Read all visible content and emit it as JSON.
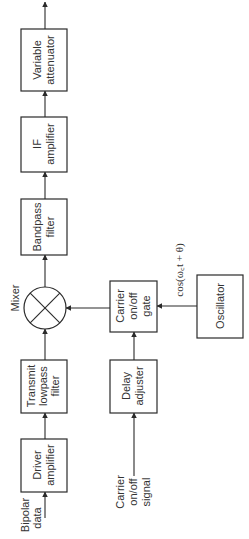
{
  "diagram": {
    "type": "block-diagram",
    "orientation": "rotated-90-ccw",
    "blocks": {
      "variable_attenuator": [
        "Variable",
        "attenuator"
      ],
      "if_amplifier": [
        "IF",
        "amplifier"
      ],
      "bandpass_filter": [
        "Bandpass",
        "filter"
      ],
      "transmit_lowpass_filter": [
        "Transmit",
        "lowpass",
        "filter"
      ],
      "driver_amplifier": [
        "Driver",
        "amplifier"
      ],
      "carrier_gate": [
        "Carrier",
        "on/off",
        "gate"
      ],
      "delay_adjuster": [
        "Delay",
        "adjuster"
      ],
      "oscillator": [
        "Oscillator"
      ]
    },
    "mixer_label": "Mixer",
    "inputs": {
      "bipolar_data": [
        "Bipolar",
        "data"
      ],
      "carrier_signal": [
        "Carrier",
        "on/off",
        "signal"
      ]
    },
    "oscillator_signal": "cos(ω꜀t + θ)",
    "connections": [
      [
        "Bipolar data",
        "Driver amplifier"
      ],
      [
        "Driver amplifier",
        "Transmit lowpass filter"
      ],
      [
        "Transmit lowpass filter",
        "Mixer"
      ],
      [
        "Carrier on/off signal",
        "Delay adjuster"
      ],
      [
        "Delay adjuster",
        "Carrier on/off gate"
      ],
      [
        "Oscillator",
        "Carrier on/off gate"
      ],
      [
        "Carrier on/off gate",
        "Mixer"
      ],
      [
        "Mixer",
        "Bandpass filter"
      ],
      [
        "Bandpass filter",
        "IF amplifier"
      ],
      [
        "IF amplifier",
        "Variable attenuator"
      ],
      [
        "Variable attenuator",
        "Output"
      ]
    ]
  }
}
